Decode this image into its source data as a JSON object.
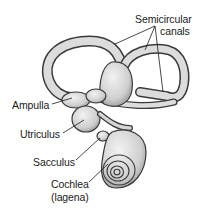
{
  "figure": {
    "labels": {
      "semicircular_line1": "Semicircular",
      "semicircular_line2": "canals",
      "ampulla": "Ampulla",
      "utriculus": "Utriculus",
      "sacculus": "Sacculus",
      "cochlea_line1": "Cochlea",
      "cochlea_line2": "(lagena)"
    },
    "colors": {
      "background": "#ffffff",
      "structure_fill": "#d9d9d9",
      "structure_stroke": "#3a3a3a",
      "leader_line": "#1a1a1a",
      "text": "#1a1a1a"
    }
  }
}
